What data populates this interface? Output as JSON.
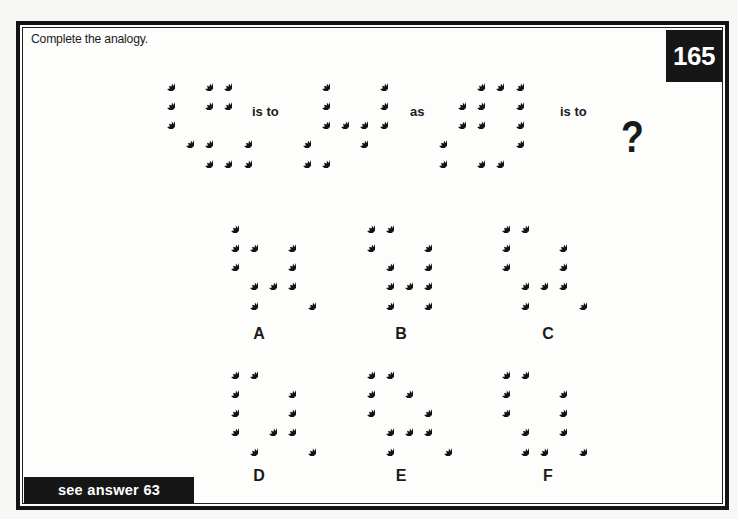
{
  "instruction": "Complete the analogy.",
  "puzzle_number": "165",
  "answer_reference": "see answer 63",
  "connectors": {
    "is_to_1": "is to",
    "as": "as",
    "is_to_2": "is to"
  },
  "unknown": "?",
  "grid_spacing_px": 19.3,
  "icon": "star-burst-icon",
  "colors": {
    "ink": "#141414",
    "paper": "#fdfdfc",
    "label_box": "#161616"
  },
  "analogy": [
    {
      "id": "figure-1",
      "origin": [
        166,
        82
      ],
      "rows": [
        [
          0,
          2,
          3
        ],
        [
          0,
          2,
          3
        ],
        [
          0
        ],
        [
          1,
          2,
          4
        ],
        [
          2,
          3,
          4
        ]
      ]
    },
    {
      "id": "figure-2",
      "origin": [
        302,
        82
      ],
      "rows": [
        [
          1,
          4
        ],
        [
          1,
          4
        ],
        [
          1,
          2,
          3,
          4
        ],
        [
          0,
          3
        ],
        [
          0,
          1
        ]
      ]
    },
    {
      "id": "figure-3",
      "origin": [
        438,
        82
      ],
      "rows": [
        [
          2,
          3,
          4
        ],
        [
          1,
          2,
          4
        ],
        [
          1,
          2,
          4
        ],
        [
          0,
          4
        ],
        [
          0,
          2,
          3
        ]
      ]
    }
  ],
  "options": [
    {
      "label": "A",
      "origin": [
        230,
        224
      ],
      "label_pos": [
        244,
        325
      ],
      "rows": [
        [
          0
        ],
        [
          0,
          1,
          3
        ],
        [
          0,
          3
        ],
        [
          1,
          2,
          3
        ],
        [
          1,
          4
        ]
      ]
    },
    {
      "label": "B",
      "origin": [
        366,
        224
      ],
      "label_pos": [
        386,
        325
      ],
      "rows": [
        [
          0,
          1
        ],
        [
          0,
          3
        ],
        [
          1,
          3
        ],
        [
          1,
          2,
          3
        ],
        [
          1,
          3
        ]
      ]
    },
    {
      "label": "C",
      "origin": [
        501,
        224
      ],
      "label_pos": [
        533,
        325
      ],
      "rows": [
        [
          0,
          1
        ],
        [
          0,
          3
        ],
        [
          0,
          3
        ],
        [
          1,
          2,
          3
        ],
        [
          1,
          4
        ]
      ]
    },
    {
      "label": "D",
      "origin": [
        230,
        370
      ],
      "label_pos": [
        244,
        467
      ],
      "rows": [
        [
          0,
          1
        ],
        [
          0,
          3
        ],
        [
          0,
          3
        ],
        [
          0,
          2,
          3
        ],
        [
          1,
          4
        ]
      ]
    },
    {
      "label": "E",
      "origin": [
        366,
        370
      ],
      "label_pos": [
        386,
        467
      ],
      "rows": [
        [
          0,
          1
        ],
        [
          0,
          2
        ],
        [
          0,
          3
        ],
        [
          1,
          2,
          3
        ],
        [
          1,
          4
        ]
      ]
    },
    {
      "label": "F",
      "origin": [
        501,
        370
      ],
      "label_pos": [
        533,
        467
      ],
      "rows": [
        [
          0,
          1
        ],
        [
          0,
          3
        ],
        [
          0,
          3
        ],
        [
          1,
          3
        ],
        [
          1,
          2,
          4
        ]
      ]
    }
  ]
}
